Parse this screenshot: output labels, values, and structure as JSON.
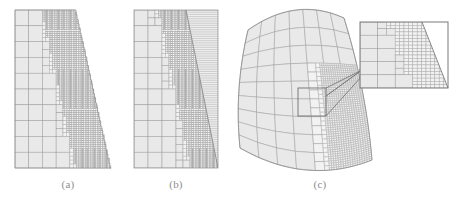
{
  "figure": {
    "kind": "scientific-figure",
    "background_color": "#ffffff",
    "width": 455,
    "height": 204
  },
  "style": {
    "cell_fill": "#e9e9e9",
    "cell_fill_light": "#f2f2f2",
    "grid_line": "#9b9b9b",
    "grid_line_fine": "#adadad",
    "boundary_line": "#8a8a8a",
    "stripe_line": "#a6a6a6",
    "callout_line": "#6f6f6f",
    "inset_border": "#7a7a7a",
    "caption_color": "#8d8d8d",
    "line_width": 0.5,
    "caption_font_size": 11
  },
  "panels": [
    {
      "id": "a",
      "name": "panel-a-staircase-quadtree",
      "caption": "(a)",
      "caption_x": 68,
      "caption_y": 178,
      "x": 15,
      "y": 10,
      "width": 96,
      "height": 158,
      "domain": {
        "shape": "trapezoid",
        "top_left": [
          0,
          0
        ],
        "top_right": [
          61,
          0
        ],
        "bottom_right": [
          96,
          158
        ],
        "bottom_left": [
          0,
          158
        ]
      },
      "boundary_style": "staircase",
      "base_cells_x": 6,
      "base_cells_y": 10,
      "max_refine_level": 3,
      "refine_band": 0.34,
      "notes": "Uniform cells at left, progressive quadtree refinement toward slanted right boundary which is approximated by a staircase of axis-aligned cell edges"
    },
    {
      "id": "b",
      "name": "panel-b-diagonal-interface-quadtree",
      "caption": "(b)",
      "caption_x": 176,
      "caption_y": 178,
      "x": 134,
      "y": 10,
      "width": 84,
      "height": 158,
      "domain": {
        "shape": "rectangle",
        "top_left": [
          0,
          0
        ],
        "top_right": [
          84,
          0
        ],
        "bottom_right": [
          84,
          158
        ],
        "bottom_left": [
          0,
          158
        ]
      },
      "boundary_style": "cut-cell-diagonal",
      "interface_top_x": 52,
      "interface_bottom_x": 84,
      "base_cells_x": 6,
      "base_cells_y": 10,
      "max_refine_level": 3,
      "refine_band": 0.3,
      "stripe_region": {
        "enabled": true,
        "name": "stretched-cell-region",
        "stripe_count": 72,
        "notes": "High aspect ratio horizontal layers filling the region right of the diagonal interface"
      }
    },
    {
      "id": "c",
      "name": "panel-c-curved-surface-quadtree",
      "caption": "(c)",
      "caption_x": 320,
      "caption_y": 178,
      "x": 240,
      "y": 8,
      "width": 132,
      "height": 162,
      "domain": {
        "shape": "curved-quadrilateral",
        "corner_top_left": [
          8,
          22
        ],
        "corner_top_right": [
          104,
          10
        ],
        "corner_bottom_right": [
          132,
          152
        ],
        "corner_bottom_left": [
          0,
          140
        ],
        "top_bow": -14,
        "bottom_bow": 16,
        "left_bow": -5,
        "right_bow": 4
      },
      "base_cells_u": 7,
      "base_cells_v": 9,
      "max_refine_level": 3,
      "refine_band": 0.3,
      "callout": {
        "name": "callout-box",
        "x": 58,
        "y": 80,
        "width": 28,
        "height": 28
      },
      "arrow": {
        "name": "callout-arrow",
        "from_x": 86,
        "from_y": 88,
        "to_x": 122,
        "to_y": 62,
        "head_size": 4
      }
    }
  ],
  "inset": {
    "name": "magnified-inset",
    "x": 360,
    "y": 22,
    "width": 88,
    "height": 66,
    "border_color": "#7a7a7a",
    "border_width": 1,
    "interface_top_x": 62,
    "interface_bottom_x": 88,
    "base_cells_x": 5,
    "base_cells_y": 5,
    "max_refine_level": 2,
    "notes": "Magnified view of the boxed region of panel (c) showing graded quadtree cells meeting the slanted trimmed edge"
  }
}
